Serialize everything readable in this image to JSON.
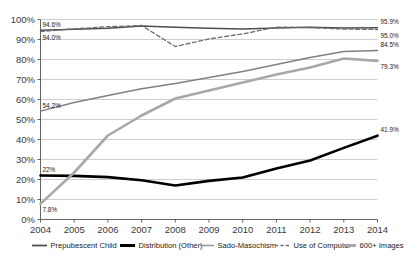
{
  "chart_data": {
    "type": "line",
    "title": "",
    "xlabel": "",
    "ylabel": "",
    "x": [
      2004,
      2005,
      2006,
      2007,
      2008,
      2009,
      2010,
      2011,
      2012,
      2013,
      2014
    ],
    "categories": [
      "2004",
      "2005",
      "2006",
      "2007",
      "2008",
      "2009",
      "2010",
      "2011",
      "2012",
      "2013",
      "2014"
    ],
    "ylim": [
      0,
      100
    ],
    "yticks": [
      0,
      10,
      20,
      30,
      40,
      50,
      60,
      70,
      80,
      90,
      100
    ],
    "ytick_labels": [
      "0%",
      "10%",
      "20%",
      "30%",
      "40%",
      "50%",
      "60%",
      "70%",
      "80%",
      "90%",
      "100%"
    ],
    "grid": true,
    "legend_position": "bottom",
    "series": [
      {
        "name": "Prepubescent Child",
        "style": "solid",
        "color": "#4d4d4d",
        "width": 1.5,
        "values": [
          94.6,
          95.1,
          95.6,
          96.8,
          96.1,
          95.6,
          95.3,
          95.7,
          96.1,
          95.8,
          95.9
        ],
        "start_label": "94.6%",
        "end_label": "95.9%"
      },
      {
        "name": "Distribution (Other)",
        "style": "solid",
        "color": "#000000",
        "width": 2.6,
        "values": [
          22.0,
          21.8,
          21.2,
          19.6,
          17.0,
          19.3,
          21.0,
          25.5,
          29.5,
          35.8,
          41.9
        ],
        "start_label": "22%",
        "end_label": "41.9%"
      },
      {
        "name": "Sado-Masochism",
        "style": "solid",
        "color": "#808080",
        "width": 1.4,
        "values": [
          54.2,
          58.5,
          62.0,
          65.4,
          68.0,
          71.0,
          74.0,
          77.5,
          81.0,
          84.0,
          84.5
        ],
        "start_label": "54.2%",
        "end_label": "84.5%"
      },
      {
        "name": "Use of Computer",
        "style": "dashed",
        "color": "#6e6e6e",
        "width": 1.3,
        "values": [
          94.0,
          95.3,
          96.4,
          97.0,
          86.5,
          90.3,
          92.8,
          96.2,
          96.0,
          95.2,
          95.0
        ],
        "start_label": "94.0%",
        "end_label": "95.0%"
      },
      {
        "name": "600+ Images",
        "style": "solid",
        "color": "#a8a8a8",
        "width": 2.6,
        "values": [
          7.8,
          23.5,
          42.0,
          52.0,
          60.5,
          64.5,
          68.5,
          72.5,
          76.0,
          80.5,
          79.3
        ],
        "start_label": "7.8%",
        "end_label": "79.3%"
      }
    ],
    "annotations": [
      {
        "text": "94.6%",
        "series": "Prepubescent Child",
        "position": "start-above"
      },
      {
        "text": "94.0%",
        "series": "Use of Computer",
        "position": "start-below"
      },
      {
        "text": "54.2%",
        "series": "Sado-Masochism",
        "position": "start-above"
      },
      {
        "text": "22%",
        "series": "Distribution (Other)",
        "position": "start-above"
      },
      {
        "text": "7.8%",
        "series": "600+ Images",
        "position": "start-below"
      },
      {
        "text": "95.9%",
        "series": "Prepubescent Child",
        "position": "end-above"
      },
      {
        "text": "95.0%",
        "series": "Use of Computer",
        "position": "end-below"
      },
      {
        "text": "84.5%",
        "series": "Sado-Masochism",
        "position": "end-above"
      },
      {
        "text": "79.3%",
        "series": "600+ Images",
        "position": "end-below"
      },
      {
        "text": "41.9%",
        "series": "Distribution (Other)",
        "position": "end-above"
      }
    ],
    "legend": [
      {
        "label": "Prepubescent Child",
        "color": "#4d4d4d",
        "style": "solid",
        "width": 1.8
      },
      {
        "label": "Distribution (Other)",
        "color": "#000000",
        "style": "solid",
        "width": 3.0
      },
      {
        "label": "Sado-Masochism",
        "color": "#9a9a9a",
        "style": "solid",
        "width": 1.6
      },
      {
        "label": "Use of Computer",
        "color": "#6e6e6e",
        "style": "dashed",
        "width": 1.4
      },
      {
        "label": "600+ Images",
        "color": "#a8a8a8",
        "style": "solid",
        "width": 3.0
      }
    ]
  }
}
